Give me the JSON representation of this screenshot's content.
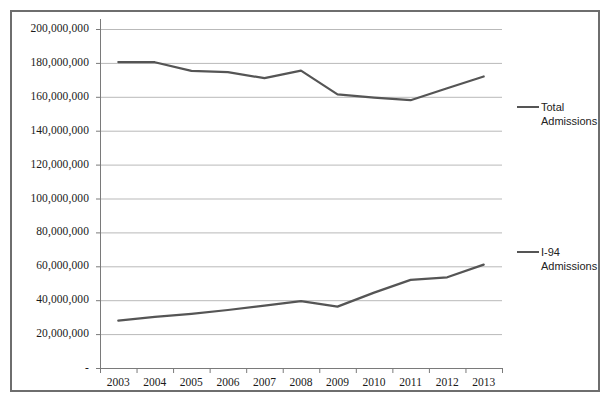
{
  "chart_data": {
    "type": "line",
    "title": "",
    "xlabel": "",
    "ylabel": "",
    "categories": [
      "2003",
      "2004",
      "2005",
      "2006",
      "2007",
      "2008",
      "2009",
      "2010",
      "2011",
      "2012",
      "2013"
    ],
    "ylim": [
      0,
      200000000
    ],
    "ytick_values": [
      0,
      20000000,
      40000000,
      60000000,
      80000000,
      100000000,
      120000000,
      140000000,
      160000000,
      180000000,
      200000000
    ],
    "ytick_labels": [
      "-",
      "20,000,000",
      "40,000,000",
      "60,000,000",
      "80,000,000",
      "100,000,000",
      "120,000,000",
      "140,000,000",
      "160,000,000",
      "180,000,000",
      "200,000,000"
    ],
    "grid": true,
    "legend_position": "right",
    "series": [
      {
        "name": "Total Admissions",
        "color": "#555555",
        "values": [
          180500000,
          180400000,
          175300000,
          174600000,
          171000000,
          175400000,
          161500000,
          159500000,
          158000000,
          165000000,
          172000000
        ]
      },
      {
        "name": "I-94 Admissions",
        "color": "#555555",
        "values": [
          27900000,
          30200000,
          32000000,
          34200000,
          36800000,
          39400000,
          36200000,
          44500000,
          52000000,
          53500000,
          61000000
        ]
      }
    ]
  },
  "legend": {
    "items": [
      {
        "label_line1": "Total",
        "label_line2": "Admissions"
      },
      {
        "label_line1": "I-94",
        "label_line2": "Admissions"
      }
    ]
  }
}
